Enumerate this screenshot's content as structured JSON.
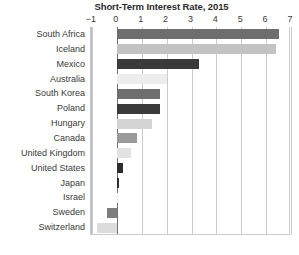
{
  "chart_data": {
    "type": "bar",
    "orientation": "horizontal",
    "title": "Short-Term Interest Rate, 2015",
    "xlabel": "",
    "ylabel": "",
    "xlim": [
      -1,
      7
    ],
    "xticks": [
      -1,
      0,
      1,
      2,
      3,
      4,
      5,
      6,
      7
    ],
    "xtick_labels": [
      "−1",
      "0",
      "1",
      "2",
      "3",
      "4",
      "5",
      "6",
      "7"
    ],
    "grid": true,
    "legend": false,
    "categories": [
      "South Africa",
      "Iceland",
      "Mexico",
      "Australia",
      "South Korea",
      "Poland",
      "Hungary",
      "Canada",
      "United Kingdom",
      "United States",
      "Japan",
      "Israel",
      "Sweden",
      "Switzerland"
    ],
    "values": [
      6.5,
      6.4,
      3.3,
      2.0,
      1.75,
      1.75,
      1.4,
      0.8,
      0.55,
      0.25,
      0.1,
      0.05,
      -0.4,
      -0.8
    ],
    "bar_colors": [
      "#6e6e6e",
      "#c3c3c3",
      "#3a3a3a",
      "#ededed",
      "#6e6e6e",
      "#3a3a3a",
      "#d4d4d4",
      "#9a9a9a",
      "#e2e2e2",
      "#2e2e2e",
      "#2e2e2e",
      "#efefef",
      "#7d7d7d",
      "#dcdcdc"
    ]
  },
  "colors": {
    "background": "#ffffff",
    "grid": "#c9ccd1",
    "zero_axis": "#6f7379",
    "text": "#3a3a3a",
    "title": "#2b2b2b"
  }
}
